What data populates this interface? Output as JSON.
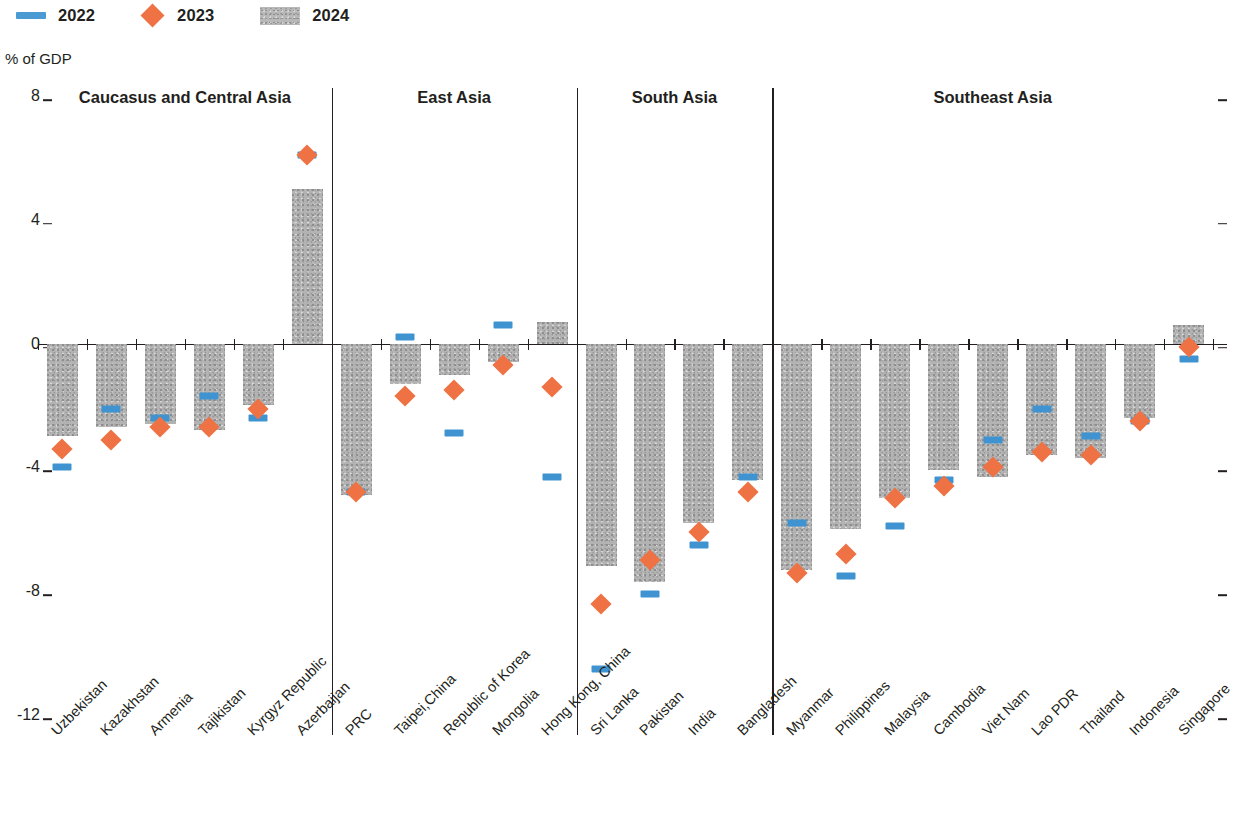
{
  "legend": [
    {
      "label": "2022",
      "type": "line",
      "color": "#4a9ad4"
    },
    {
      "label": "2023",
      "type": "diamond",
      "color": "#ef7245"
    },
    {
      "label": "2024",
      "type": "bar",
      "color": "#b3b3b3"
    }
  ],
  "axis_title": "% of GDP",
  "groups": [
    {
      "name": "Caucasus and Central Asia"
    },
    {
      "name": "East Asia"
    },
    {
      "name": "South Asia"
    },
    {
      "name": "Southeast Asia"
    }
  ],
  "chart_data": {
    "type": "bar",
    "title": "",
    "subtitle": "",
    "xlabel": "",
    "ylabel": "% of GDP",
    "ylim": [
      -12,
      8
    ],
    "yticks": [
      8,
      4,
      0,
      -4,
      -8,
      -12
    ],
    "grid": false,
    "legend_position": "top-left",
    "group_labels": [
      "Caucasus and Central Asia",
      "East Asia",
      "South Asia",
      "Southeast Asia"
    ],
    "group_sizes": [
      6,
      5,
      4,
      9
    ],
    "categories": [
      "Uzbekistan",
      "Kazakhstan",
      "Armenia",
      "Tajikistan",
      "Kyrgyz Republic",
      "Azerbaijan",
      "PRC",
      "Taipei,China",
      "Republic of Korea",
      "Mongolia",
      "Hong Kong, China",
      "Sri Lanka",
      "Pakistan",
      "India",
      "Bangladesh",
      "Myanmar",
      "Philippines",
      "Malaysia",
      "Cambodia",
      "Viet Nam",
      "Lao PDR",
      "Thailand",
      "Indonesia",
      "Singapore"
    ],
    "series": [
      {
        "name": "2022",
        "type": "line-marker",
        "color": "#4a9ad4",
        "values": [
          -4.0,
          -2.1,
          -2.4,
          -1.7,
          -2.4,
          6.1,
          -4.8,
          0.2,
          -2.9,
          0.6,
          -4.3,
          -10.5,
          -8.1,
          -6.5,
          -4.3,
          -5.8,
          -7.5,
          -5.9,
          -4.4,
          -3.1,
          -2.1,
          -3.0,
          -2.5,
          -0.5
        ]
      },
      {
        "name": "2023",
        "type": "diamond-marker",
        "color": "#ef7245",
        "values": [
          -3.4,
          -3.1,
          -2.7,
          -2.7,
          -2.1,
          6.1,
          -4.8,
          -1.7,
          -1.5,
          -0.7,
          -1.4,
          -8.4,
          -7.0,
          -6.1,
          -4.8,
          -7.4,
          -6.8,
          -5.0,
          -4.6,
          -4.0,
          -3.5,
          -3.6,
          -2.5,
          -0.1
        ]
      },
      {
        "name": "2024",
        "type": "bar",
        "color": "#b3b3b3",
        "values": [
          -3.0,
          -2.7,
          -2.6,
          -2.8,
          -2.0,
          5.0,
          -4.9,
          -1.3,
          -1.0,
          -0.6,
          0.7,
          -7.2,
          -7.7,
          -5.8,
          -4.4,
          -7.3,
          -6.0,
          -5.0,
          -4.1,
          -4.3,
          -3.6,
          -3.7,
          -2.4,
          0.6
        ]
      }
    ]
  }
}
